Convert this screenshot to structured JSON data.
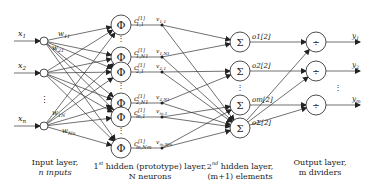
{
  "diagram": {
    "input_layer": {
      "inputs": [
        {
          "label": "x1",
          "y": 41
        },
        {
          "label": "x2",
          "y": 73
        },
        {
          "label": "xn",
          "y": 126
        }
      ],
      "weights": [
        "w11",
        "w21",
        "w1N",
        "wNn"
      ],
      "caption_line1": "Input layer,",
      "caption_line2": "n inputs"
    },
    "hidden1": {
      "symbol": "Φ",
      "nodes": [
        {
          "center_label": "c",
          "sup": "[1]",
          "sub": "1,1",
          "v": "v1,1",
          "y": 25
        },
        {
          "center_label": "c",
          "sup": "[1]",
          "sub": "1,N1",
          "v": "v1,N1",
          "y": 57
        },
        {
          "center_label": "c",
          "sup": "[1]",
          "sub": "2,1",
          "v": "v2,1",
          "y": 72
        },
        {
          "center_label": "c",
          "sup": "[1]",
          "sub": "2,N1",
          "v": "v2,N1",
          "y": 103
        },
        {
          "center_label": "c",
          "sup": "[1]",
          "sub": "m,1",
          "v": "vm,1",
          "y": 117
        },
        {
          "center_label": "c",
          "sup": "[1]",
          "sub": "m,Nm",
          "v": "vm,Nm",
          "y": 148
        }
      ],
      "caption_line1": "1st hidden (prototype) layer,",
      "caption_line2": "N neurons"
    },
    "hidden2": {
      "symbol": "Σ",
      "nodes": [
        {
          "label": "o1[2]",
          "y": 42
        },
        {
          "label": "o2[2]",
          "y": 71
        },
        {
          "label": "om[2]",
          "y": 105
        },
        {
          "label": "oΣ[2]",
          "y": 128
        }
      ],
      "caption_line1": "2nd hidden layer,",
      "caption_line2": "(m+1) elements"
    },
    "output_layer": {
      "symbol": "÷",
      "nodes": [
        {
          "label": "y1",
          "y": 42
        },
        {
          "label": "y2",
          "y": 71
        },
        {
          "label": "ym",
          "y": 105
        }
      ],
      "caption_line1": "Output layer,",
      "caption_line2": "m dividers"
    },
    "ellipsis": "⋮"
  }
}
